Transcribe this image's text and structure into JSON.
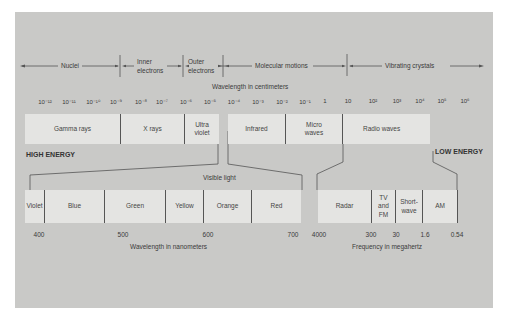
{
  "diagram": {
    "sources": {
      "items": [
        "Nuclei",
        "Inner electrons",
        "Outer electrons",
        "Molecular motions",
        "Vibrating crystals"
      ]
    },
    "wavelength_axis": {
      "label": "Wavelength in centimeters",
      "ticks": [
        "10⁻¹²",
        "10⁻¹¹",
        "10⁻¹⁰",
        "10⁻⁹",
        "10⁻⁸",
        "10⁻⁷",
        "10⁻⁶",
        "10⁻⁵",
        "10⁻⁴",
        "10⁻³",
        "10⁻²",
        "10⁻¹",
        "1",
        "10",
        "10²",
        "10³",
        "10⁴",
        "10⁵",
        "10⁶"
      ]
    },
    "spectrum_bands": [
      "Gamma rays",
      "X rays",
      "Ultra violet",
      "Infrared",
      "Micro waves",
      "Radio waves"
    ],
    "energy_labels": {
      "high": "HIGH ENERGY",
      "low": "LOW ENERGY"
    },
    "visible_light": {
      "label": "Visible light",
      "colors": [
        "Violet",
        "Blue",
        "Green",
        "Yellow",
        "Orange",
        "Red"
      ],
      "ticks": [
        "400",
        "500",
        "600",
        "700"
      ],
      "axis_label": "Wavelength in nanometers"
    },
    "radio": {
      "bands": [
        "Radar",
        "TV and FM",
        "Short-wave",
        "AM"
      ],
      "ticks": [
        "4000",
        "300",
        "30",
        "1.6",
        "0.54"
      ],
      "axis_label": "Frequency in megahertz"
    },
    "colors": {
      "panel_bg": "#c9c9c7",
      "band_bg": "#e4e4e2",
      "line": "#444444"
    }
  }
}
